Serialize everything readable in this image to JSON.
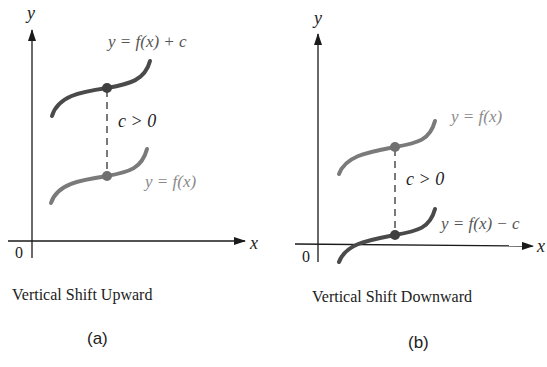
{
  "panels": [
    {
      "id": "a",
      "caption": "Vertical Shift Upward",
      "label": "(a)",
      "axis_x": "x",
      "axis_y": "y",
      "origin": "0",
      "upper_curve_label": "y = f(x) + c",
      "lower_curve_label": "y = f(x)",
      "gap_label": "c > 0"
    },
    {
      "id": "b",
      "caption": "Vertical Shift Downward",
      "label": "(b)",
      "axis_x": "x",
      "axis_y": "y",
      "origin": "0",
      "upper_curve_label": "y = f(x)",
      "lower_curve_label": "y = f(x) − c",
      "gap_label": "c > 0"
    }
  ],
  "colors": {
    "axis": "#1a1a1a",
    "shifted_curve": "#4a4a4a",
    "original_curve": "#7a7a7a",
    "original_label": "#8a8a8a",
    "text": "#222222"
  }
}
